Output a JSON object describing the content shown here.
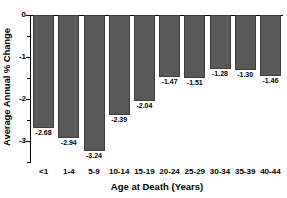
{
  "chart_data": {
    "type": "bar",
    "title": "",
    "xlabel": "Age at Death (Years)",
    "ylabel": "Average Annual % Change",
    "categories": [
      "<1",
      "1-4",
      "5-9",
      "10-14",
      "15-19",
      "20-24",
      "25-29",
      "30-34",
      "35-39",
      "40-44"
    ],
    "values": [
      -2.68,
      -2.94,
      -3.24,
      -2.39,
      -2.04,
      -1.47,
      -1.51,
      -1.28,
      -1.3,
      -1.46
    ],
    "value_labels": [
      "-2.68",
      "-2.94",
      "-3.24",
      "-2.39",
      "-2.04",
      "-1.47",
      "-1.51",
      "-1.28",
      "-1.30",
      "-1.46"
    ],
    "ylim": [
      -3.5,
      0
    ],
    "ytick_labels": [
      "0",
      "-1",
      "-2",
      "-3"
    ],
    "ytick_values": [
      0,
      -1,
      -2,
      -3
    ],
    "grid": false,
    "legend": null,
    "bar_color": "#595959",
    "bar_edge_color": "#3d3d3d",
    "axis_color": "#000000",
    "background": "#ffffff"
  }
}
